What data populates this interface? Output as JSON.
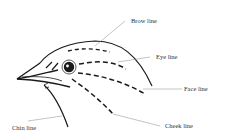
{
  "diagram": {
    "labels": {
      "brow": "Brow line",
      "eye": "Eye line",
      "face": "Face line",
      "cheek": "Cheek line",
      "chin": "Chin line"
    },
    "colors": {
      "ink": "#1a1a1a",
      "leader": "#888888",
      "text": "#333333",
      "background": "#ffffff"
    }
  }
}
